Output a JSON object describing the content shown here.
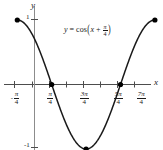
{
  "figure": {
    "equation_label": {
      "lhs": "y",
      "eq": "=",
      "fn": "cos",
      "open_paren": "(",
      "arg_var": "x",
      "plus": "+",
      "frac_num": "π",
      "frac_den": "4",
      "close_paren": ")"
    },
    "axis_names": {
      "x": "x",
      "y": "y"
    },
    "y_tick_labels": {
      "top": "1",
      "bottom": "-1"
    }
  },
  "chart_data": {
    "type": "line",
    "title": "",
    "subtitle": "",
    "annotation": "y = cos(x + π/4)",
    "xlabel": "x",
    "ylabel": "y",
    "function": "y = cos(x + pi/4)",
    "xlim_pi_over_4_units": [
      -1,
      7
    ],
    "ylim": [
      -1,
      1
    ],
    "grid": false,
    "legend": false,
    "x_tick_labels": [
      "-π/4",
      "π/4",
      "3π/4",
      "5π/4",
      "7π/4"
    ],
    "x_tick_values_pi_over_4_units": [
      -1,
      1,
      3,
      5,
      7
    ],
    "x_tick_labels_parts": [
      {
        "sign": "-",
        "num": "π",
        "den": "4"
      },
      {
        "sign": "",
        "num": "π",
        "den": "4"
      },
      {
        "sign": "",
        "num": "3π",
        "den": "4"
      },
      {
        "sign": "",
        "num": "5π",
        "den": "4"
      },
      {
        "sign": "",
        "num": "7π",
        "den": "4"
      }
    ],
    "x_minor_tick_values_pi_over_4_units": [
      0,
      2,
      4,
      6
    ],
    "y_tick_values": [
      1,
      -1
    ],
    "marked_points": [
      {
        "x_pi_over_4_units": -1,
        "y": 1,
        "role": "left-endpoint-maximum"
      },
      {
        "x_pi_over_4_units": 1,
        "y": 0,
        "role": "x-intercept"
      },
      {
        "x_pi_over_4_units": 3,
        "y": -1,
        "role": "minimum"
      },
      {
        "x_pi_over_4_units": 5,
        "y": 0,
        "role": "x-intercept"
      },
      {
        "x_pi_over_4_units": 7,
        "y": 1,
        "role": "right-endpoint-maximum"
      }
    ],
    "curve_points": [
      {
        "x": -1,
        "y": 1.0
      },
      {
        "x": -0.5,
        "y": 0.924
      },
      {
        "x": 0,
        "y": 0.707
      },
      {
        "x": 0.5,
        "y": 0.383
      },
      {
        "x": 1,
        "y": 0.0
      },
      {
        "x": 1.5,
        "y": -0.383
      },
      {
        "x": 2,
        "y": -0.707
      },
      {
        "x": 2.5,
        "y": -0.924
      },
      {
        "x": 3,
        "y": -1.0
      },
      {
        "x": 3.5,
        "y": -0.924
      },
      {
        "x": 4,
        "y": -0.707
      },
      {
        "x": 4.5,
        "y": -0.383
      },
      {
        "x": 5,
        "y": 0.0
      },
      {
        "x": 5.5,
        "y": 0.383
      },
      {
        "x": 6,
        "y": 0.707
      },
      {
        "x": 6.5,
        "y": 0.924
      },
      {
        "x": 7,
        "y": 1.0
      }
    ],
    "colors": {
      "curve": "#1a1a1a",
      "axis": "#4d4d4d",
      "point": "#000000",
      "text": "#1a1a1a",
      "background": "#ffffff"
    }
  }
}
